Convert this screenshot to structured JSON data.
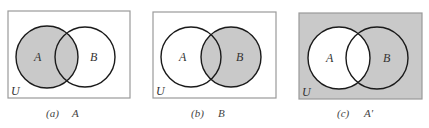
{
  "colors": {
    "background": "#ffffff",
    "shade": "#c9c9c9",
    "frame": "#9a9a9a",
    "stroke": "#1a1a1a"
  },
  "universe_label": "U",
  "panels": [
    {
      "id": "a",
      "caption_letter": "(a)",
      "caption_set": "A",
      "shaded": "A",
      "labels": {
        "A": "A",
        "B": "B",
        "U": "U"
      }
    },
    {
      "id": "b",
      "caption_letter": "(b)",
      "caption_set": "B",
      "shaded": "B",
      "labels": {
        "A": "A",
        "B": "B",
        "U": "U"
      }
    },
    {
      "id": "c",
      "caption_letter": "(c)",
      "caption_set": "A′",
      "shaded": "complement of A",
      "labels": {
        "A": "A",
        "B": "B",
        "U": "U"
      }
    }
  ]
}
